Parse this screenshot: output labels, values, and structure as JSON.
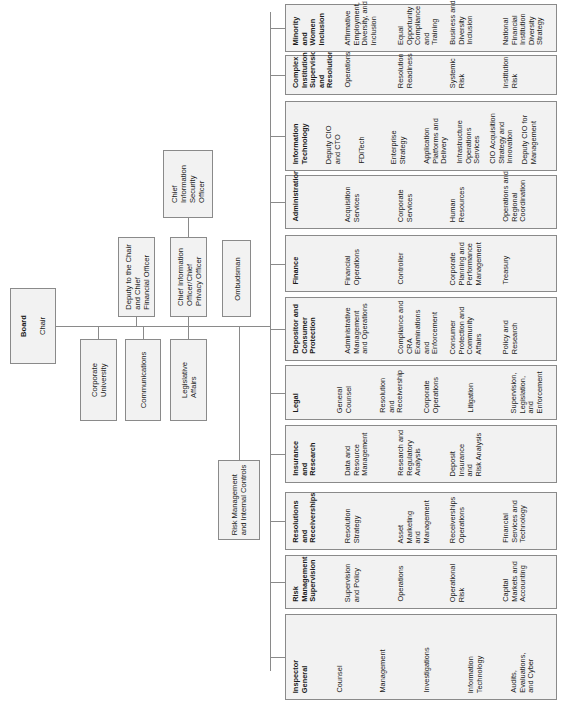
{
  "chart": {
    "type": "org-chart",
    "orientation": "rotated-90-ccw",
    "root": {
      "title": "Board",
      "subtitle": "Chair"
    },
    "staff_above": [
      {
        "id": "deputy",
        "label": "Deputy to the Chair\nand Chief\nFinancial Officer"
      },
      {
        "id": "cio",
        "label": "Chief Information\nOfficer/Chief\nPrivacy Officer",
        "child": {
          "id": "ciso",
          "label": "Chief\nInformation\nSecurity\nOfficer"
        }
      },
      {
        "id": "ombudsman",
        "label": "Ombudsman"
      }
    ],
    "staff_below": [
      {
        "id": "corp-univ",
        "label": "Corporate\nUniversity"
      },
      {
        "id": "communications",
        "label": "Communications"
      },
      {
        "id": "legislative",
        "label": "Legislative\nAffairs"
      },
      {
        "id": "risk-internal",
        "label": "Risk Management\nand Internal Controls"
      }
    ],
    "divisions": [
      {
        "id": "inspector-general",
        "title": "Inspector\nGeneral",
        "units": [
          "Counsel",
          "Management",
          "Investigations",
          "Information\nTechnology",
          "Audits,\nEvaluations,\nand Cyber"
        ]
      },
      {
        "id": "rms",
        "title": "Risk\nManagement\nSupervision",
        "units": [
          "Supervision\nand Policy",
          "Operations",
          "Operational\nRisk",
          "Capital\nMarkets and\nAccounting"
        ]
      },
      {
        "id": "resolutions",
        "title": "Resolutions\nand\nReceiverships",
        "units": [
          "Resolution\nStrategy",
          "Asset\nMarketing\nand\nManagement",
          "Receiverships\nOperations",
          "Financial\nServices and\nTechnology"
        ]
      },
      {
        "id": "insurance",
        "title": "Insurance\nand\nResearch",
        "units": [
          "Data and\nResource\nManagement",
          "Research and\nRegulatory\nAnalysis",
          "Deposit\nInsurance\nand\nRisk Analysis"
        ]
      },
      {
        "id": "legal",
        "title": "Legal",
        "units": [
          "General\nCounsel",
          "Resolution\nand\nReceivership",
          "Corporate\nOperations",
          "Litigation",
          "Supervision,\nLegislation,\nand\nEnforcement"
        ]
      },
      {
        "id": "dcp",
        "title": "Depositor and\nConsumer\nProtection",
        "units": [
          "Administrative\nManagement\nand Operations",
          "Compliance and\nCRA\nExaminations\nand\nEnforcement",
          "Consumer\nProtection and\nCommunity\nAffairs",
          "Policy and\nResearch"
        ]
      },
      {
        "id": "finance",
        "title": "Finance",
        "units": [
          "Financial\nOperations",
          "Controller",
          "Corporate\nPlanning and\nPerformance\nManagement",
          "Treasury"
        ]
      },
      {
        "id": "administration",
        "title": "Administration",
        "units": [
          "Acquisition\nServices",
          "Corporate\nServices",
          "Human\nResources",
          "Operations and\nRegional\nCoordination"
        ]
      },
      {
        "id": "it",
        "title": "Information\nTechnology",
        "units": [
          "Deputy CIO\nand CTO",
          "FDiTech",
          "Enterprise\nStrategy",
          "Application\nPlatforms and\nDelivery",
          "Infrastructure\nOperations\nServices",
          "CIO Acquisition\nStrategy and\nInnovation",
          "Deputy CIO for\nManagement"
        ]
      },
      {
        "id": "cisr",
        "title": "Complex\nInstitution\nSupervision\nand\nResolution",
        "units": [
          "Operations",
          "Resolution\nReadiness",
          "Systemic\nRisk",
          "Institution\nRisk"
        ]
      },
      {
        "id": "mwi",
        "title": "Minority\nand\nWomen\nInclusion",
        "units": [
          "Affirmative\nEmployment,\nDiversity, and\nInclusion",
          "Equal\nOpportunity\nCompliance\nand\nTraining",
          "Business and\nDiversity\nInclusion",
          "National\nFinancial\nInstitution\nDiversity\nStrategy"
        ]
      }
    ]
  },
  "colors": {
    "box_fill": "#f2f2f2",
    "border": "#8a8a8a",
    "text": "#1a1a1a"
  }
}
